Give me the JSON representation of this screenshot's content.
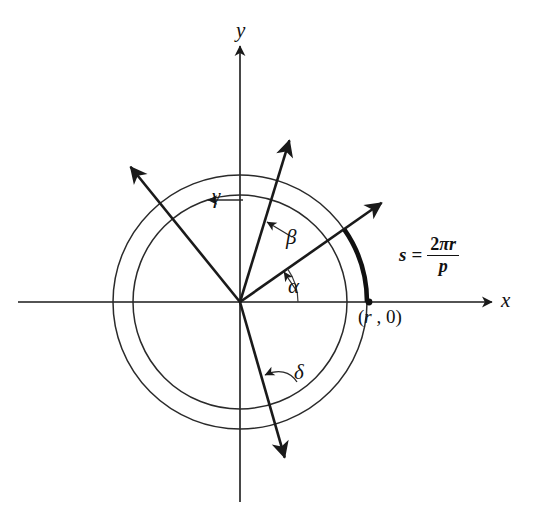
{
  "figure": {
    "kind": "math-diagram",
    "background_color": "#ffffff",
    "ink_color": "#111111"
  },
  "axes": {
    "x_label": "x",
    "y_label": "y",
    "origin": {
      "x": 240,
      "y": 302
    }
  },
  "circles": [
    {
      "name": "outer-circle",
      "radius": 127
    },
    {
      "name": "inner-circle",
      "radius": 107
    }
  ],
  "rays": [
    {
      "name": "alpha-ray",
      "label": "α",
      "angle_deg": 35
    },
    {
      "name": "beta-ray",
      "label": "β",
      "angle_deg": 73
    },
    {
      "name": "gamma-ray",
      "label": "γ",
      "angle_deg": 129
    },
    {
      "name": "delta-ray",
      "label": "δ",
      "angle_deg": -74
    }
  ],
  "labels": {
    "alpha": "α",
    "beta": "β",
    "gamma": "γ",
    "delta": "δ",
    "point": "(r , 0)",
    "point_var": "r",
    "point_open": "(",
    "point_rest": " , 0)"
  },
  "formula": {
    "lhs": "s",
    "equals": "=",
    "numerator_coeff": "2",
    "numerator_pi": "π",
    "numerator_var": "r",
    "denominator": "p",
    "plain": "s = 2πr/p"
  },
  "arc_s": {
    "name": "highlighted-arc",
    "from_angle_deg": 0,
    "to_angle_deg": 35,
    "radius": 127
  }
}
